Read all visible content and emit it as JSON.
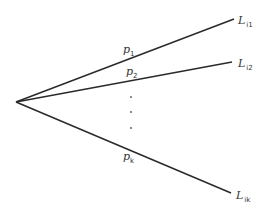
{
  "diagram": {
    "type": "probability tree (one node with k branches)",
    "branches": [
      {
        "id": "1",
        "probability": {
          "symbol": "p",
          "subscript": "1"
        },
        "outcome": {
          "symbol": "L",
          "subscript": "i1"
        }
      },
      {
        "id": "2",
        "probability": {
          "symbol": "p",
          "subscript": "2"
        },
        "outcome": {
          "symbol": "L",
          "subscript": "i2"
        }
      },
      {
        "id": "k",
        "probability": {
          "symbol": "p",
          "subscript": "k"
        },
        "outcome": {
          "symbol": "L",
          "subscript": "ik"
        }
      }
    ],
    "ellipsis": ".",
    "colors": {
      "line": "#2a2a2a",
      "text": "#333333",
      "background": "#ffffff"
    }
  }
}
